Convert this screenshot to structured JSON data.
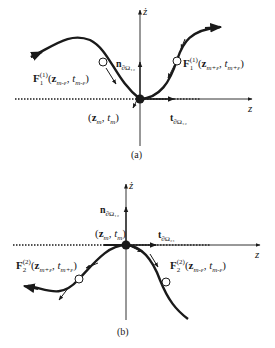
{
  "figure": {
    "panel_a": {
      "caption": "(a)",
      "axis_x_label": "z",
      "axis_y_label": "ż",
      "normal_label": {
        "main": "n",
        "sub": "∂Ω₁₂"
      },
      "tangent_label": {
        "main": "t",
        "sub": "∂Ω₁₂"
      },
      "point_label": {
        "z": "z",
        "zsub": "m",
        "t": "t",
        "tsub": "m"
      },
      "left_flow_label": {
        "F": "F",
        "Fsub": "1",
        "Fsup": "(1)",
        "z": "z",
        "zsub": "m-ε",
        "t": "t",
        "tsub": "m-ε"
      },
      "right_flow_label": {
        "F": "F",
        "Fsub": "1",
        "Fsup": "(1)",
        "z": "z",
        "zsub": "m+ε",
        "t": "t",
        "tsub": "m+ε"
      }
    },
    "panel_b": {
      "caption": "(b)",
      "axis_x_label": "z",
      "axis_y_label": "ż",
      "normal_label": {
        "main": "n",
        "sub": "∂Ω₁₂"
      },
      "tangent_label": {
        "main": "t",
        "sub": "∂Ω₂₁"
      },
      "point_label": {
        "z": "z",
        "zsub": "m",
        "t": "t",
        "tsub": "m"
      },
      "left_flow_label": {
        "F": "F",
        "Fsub": "2",
        "Fsup": "(2)",
        "z": "z",
        "zsub": "m+ε",
        "t": "t",
        "tsub": "m+ε"
      },
      "right_flow_label": {
        "F": "F",
        "Fsub": "2",
        "Fsup": "(2)",
        "z": "z",
        "zsub": "m-ε",
        "t": "t",
        "tsub": "m-ε"
      }
    },
    "colors": {
      "ink": "#1a1a1a",
      "axis": "#333333",
      "background": "#ffffff"
    }
  }
}
